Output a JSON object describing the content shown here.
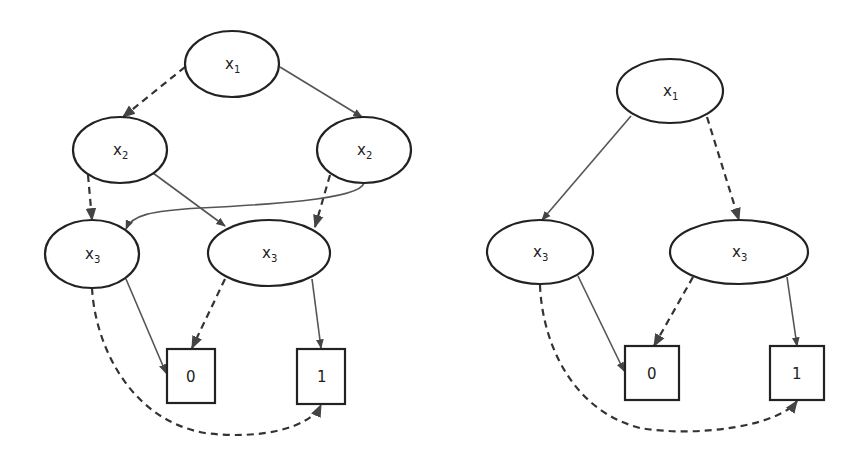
{
  "diagrams": [
    {
      "id": "left",
      "nodes": [
        {
          "var": "x",
          "sub": "1"
        },
        {
          "var": "x",
          "sub": "2"
        },
        {
          "var": "x",
          "sub": "2"
        },
        {
          "var": "x",
          "sub": "3"
        },
        {
          "var": "x",
          "sub": "3"
        }
      ],
      "terminals": [
        "0",
        "1"
      ],
      "edges": [
        {
          "from": "x1",
          "to": "x2 (left)",
          "style": "dashed"
        },
        {
          "from": "x1",
          "to": "x2 (right)",
          "style": "solid"
        },
        {
          "from": "x2 (left)",
          "to": "x3 (left)",
          "style": "dashed"
        },
        {
          "from": "x2 (left)",
          "to": "x3 (right)",
          "style": "solid"
        },
        {
          "from": "x2 (right)",
          "to": "x3 (right)",
          "style": "dashed"
        },
        {
          "from": "x2 (right)",
          "to": "x3 (left)",
          "style": "solid"
        },
        {
          "from": "x3 (left)",
          "to": "0",
          "style": "solid"
        },
        {
          "from": "x3 (left)",
          "to": "1",
          "style": "dashed"
        },
        {
          "from": "x3 (right)",
          "to": "0",
          "style": "dashed"
        },
        {
          "from": "x3 (right)",
          "to": "1",
          "style": "solid"
        }
      ]
    },
    {
      "id": "right",
      "nodes": [
        {
          "var": "x",
          "sub": "1"
        },
        {
          "var": "x",
          "sub": "3"
        },
        {
          "var": "x",
          "sub": "3"
        }
      ],
      "terminals": [
        "0",
        "1"
      ],
      "edges": [
        {
          "from": "x1",
          "to": "x3 (left)",
          "style": "solid"
        },
        {
          "from": "x1",
          "to": "x3 (right)",
          "style": "dashed"
        },
        {
          "from": "x3 (left)",
          "to": "0",
          "style": "solid"
        },
        {
          "from": "x3 (left)",
          "to": "1",
          "style": "dashed"
        },
        {
          "from": "x3 (right)",
          "to": "0",
          "style": "dashed"
        },
        {
          "from": "x3 (right)",
          "to": "1",
          "style": "solid"
        }
      ]
    }
  ],
  "colors": {
    "stroke": "#222222",
    "solid_edge": "#555555",
    "background": "#ffffff"
  }
}
